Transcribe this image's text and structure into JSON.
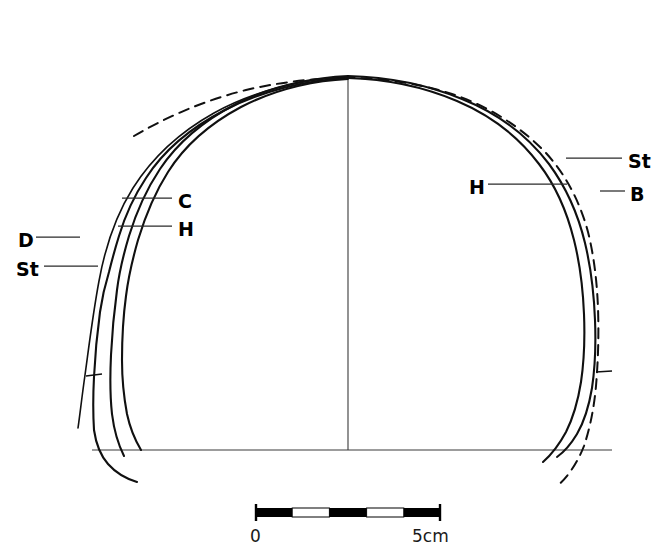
{
  "figure": {
    "domain": "scientific-line-drawing",
    "background_color": "#ffffff",
    "ink_color": "#101010",
    "axis_color": "#3a3a3a",
    "width": 668,
    "height": 559
  },
  "labels": {
    "left": [
      {
        "id": "C",
        "text": "C",
        "x": 178,
        "y": 201,
        "leader_from_x": 172,
        "leader_to_x": 122,
        "leader_y": 198
      },
      {
        "id": "H",
        "text": "H",
        "x": 178,
        "y": 229,
        "leader_from_x": 172,
        "leader_to_x": 118,
        "leader_y": 226
      },
      {
        "id": "D",
        "text": "D",
        "x": 20,
        "y": 240,
        "leader_from_x": 36,
        "leader_to_x": 80,
        "leader_y": 237
      },
      {
        "id": "St",
        "text": "St",
        "x": 18,
        "y": 269,
        "leader_from_x": 44,
        "leader_to_x": 98,
        "leader_y": 266
      }
    ],
    "right": [
      {
        "id": "St",
        "text": "St",
        "x": 629,
        "y": 161,
        "leader_from_x": 622,
        "leader_to_x": 566,
        "leader_y": 158
      },
      {
        "id": "B",
        "text": "B",
        "x": 631,
        "y": 194,
        "leader_from_x": 625,
        "leader_to_x": 600,
        "leader_y": 191
      },
      {
        "id": "H",
        "text": "H",
        "x": 470,
        "y": 187,
        "leader_from_x": 488,
        "leader_to_x": 567,
        "leader_y": 184
      }
    ]
  },
  "scale_bar": {
    "start_label": "0",
    "end_label": "5cm",
    "x_start": 255,
    "x_end": 441,
    "y": 512,
    "bar_height": 9,
    "segments": 5,
    "segment_fills": [
      "black",
      "white",
      "black",
      "white",
      "black"
    ],
    "start_label_x": 252,
    "start_label_y": 538,
    "end_label_x": 413,
    "end_label_y": 538
  },
  "geometry": {
    "baseline": {
      "x1": 92,
      "y1": 450,
      "x2": 612,
      "y2": 450
    },
    "centerline": {
      "x": 348,
      "y1": 80,
      "y2": 450
    },
    "apex": {
      "x": 348,
      "y": 75
    },
    "tick_left": {
      "x": 93,
      "y": 376
    },
    "tick_right": {
      "x": 604,
      "y": 372
    }
  },
  "curves": {
    "outer_left_D": "D — outermost left solid profile",
    "inner_left_St": "St — left stratigraphic solid profile",
    "mid_left_C": "C — left core solid profile",
    "mid_left_H": "H — left H solid profile",
    "dashed_profile": "dashed comparative profile spanning both sides",
    "right_B": "B — outermost right solid profile",
    "right_H": "H — right inner solid profile",
    "right_St": "St — right dashed stratigraphic profile"
  }
}
